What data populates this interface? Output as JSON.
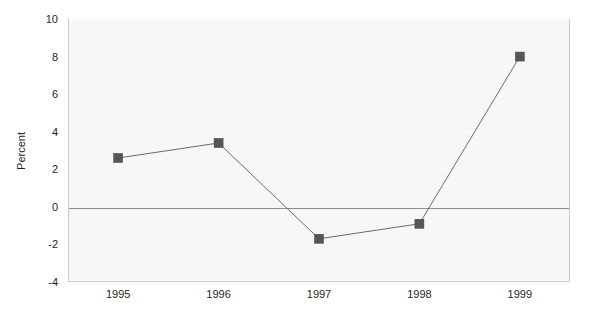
{
  "chart_data": {
    "type": "line",
    "title": "",
    "subtitle": "",
    "xlabel": "",
    "ylabel": "Percent",
    "categories": [
      "1995",
      "1996",
      "1997",
      "1998",
      "1999"
    ],
    "values": [
      2.6,
      3.4,
      -1.7,
      -0.9,
      8.0
    ],
    "series": [
      {
        "name": "Percent",
        "values": [
          2.6,
          3.4,
          -1.7,
          -0.9,
          8.0
        ]
      }
    ],
    "ylim": [
      -4,
      10
    ],
    "y_ticks": [
      10,
      8,
      6,
      4,
      2,
      0,
      -2,
      -4
    ],
    "y_tick_labels": [
      "10",
      "8",
      "6",
      "4",
      "2",
      "0",
      "-2",
      "-4"
    ],
    "x_tick_labels": [
      "1995",
      "1996",
      "1997",
      "1998",
      "1999"
    ],
    "grid": true,
    "legend": "none",
    "zero_line": 0,
    "marker": "square",
    "colors": {
      "marker_fill": "#565656",
      "line": "#6b6b6b",
      "plot_background": "#f7f7f7",
      "plot_border": "#c9c9c9",
      "zero_line": "#8d8d8d",
      "gridline": "#fbfbfb",
      "text": "#231f20",
      "page_background": "#ffffff"
    }
  }
}
